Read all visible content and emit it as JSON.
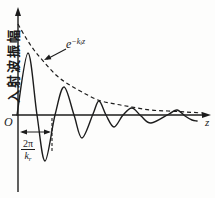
{
  "figure": {
    "kind": "damped-wave-diagram",
    "ink_color": "#1c1c1c",
    "background": "#fdfdfc",
    "axes": {
      "y_axis": {
        "x": 18,
        "y_top": 7,
        "y_bottom": 192,
        "label": "入射波振幅"
      },
      "x_axis": {
        "y": 115,
        "x_left": 12,
        "x_right": 211,
        "label": "z"
      },
      "origin_label": "O"
    },
    "envelope": {
      "label": {
        "base": "e",
        "sup_main": "−k",
        "sup_sub": "i",
        "sup_tail": "z"
      },
      "dash_pattern": "4 3",
      "points": [
        [
          18,
          24
        ],
        [
          26,
          38
        ],
        [
          34,
          50
        ],
        [
          44,
          62
        ],
        [
          56,
          75
        ],
        [
          68,
          84
        ],
        [
          82,
          92
        ],
        [
          98,
          100
        ],
        [
          115,
          104
        ],
        [
          132,
          107
        ],
        [
          150,
          110
        ],
        [
          168,
          111
        ],
        [
          186,
          112
        ],
        [
          202,
          113
        ]
      ],
      "pointer_arrow": {
        "x1": 66,
        "y1": 49,
        "x2": 44,
        "y2": 60
      }
    },
    "wave": {
      "points": [
        [
          17,
          115
        ],
        [
          28,
          53
        ],
        [
          37,
          115
        ],
        [
          45,
          161
        ],
        [
          55,
          115
        ],
        [
          64,
          87
        ],
        [
          74,
          115
        ],
        [
          82,
          138
        ],
        [
          93,
          114
        ],
        [
          99,
          101
        ],
        [
          106,
          115
        ],
        [
          114,
          127
        ],
        [
          123,
          115
        ],
        [
          132,
          108
        ],
        [
          141,
          116
        ],
        [
          151,
          123
        ],
        [
          169,
          114
        ],
        [
          177,
          110
        ],
        [
          185,
          116
        ],
        [
          192,
          120
        ],
        [
          197,
          121
        ]
      ]
    },
    "period_marker": {
      "arrow": {
        "x1": 20,
        "x2": 51,
        "y": 132
      },
      "dash_line": {
        "x": 52,
        "y1": 118,
        "y2": 152,
        "dash_pattern": "3 2"
      },
      "label": {
        "numerator": "2π",
        "den_base": "k",
        "den_sub": "r"
      }
    }
  }
}
